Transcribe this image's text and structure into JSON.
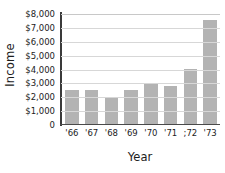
{
  "chart_data": {
    "type": "bar",
    "title": "",
    "xlabel": "Year",
    "ylabel": "Income",
    "categories": [
      "'66",
      "'67",
      "'68",
      "'69",
      "'70",
      "'71",
      ";72",
      "'73"
    ],
    "values": [
      2450,
      2450,
      1950,
      2420,
      2980,
      2750,
      3980,
      7500
    ],
    "ylim": [
      0,
      8000
    ],
    "ytick_values": [
      8000,
      7000,
      6000,
      5000,
      4000,
      3000,
      2000,
      1000,
      0
    ],
    "ytick_labels": [
      "$8,000",
      "$7,000",
      "$6,000",
      "$5,000",
      "$4,000",
      "$3,000",
      "$2,000",
      "$1,000",
      "0"
    ],
    "grid": true,
    "legend": false,
    "bar_color": "#b3b3b3",
    "gridline_color": "#d7d7d7",
    "axis_color": "#3a3a3a",
    "text_color": "#1c1c1c"
  }
}
